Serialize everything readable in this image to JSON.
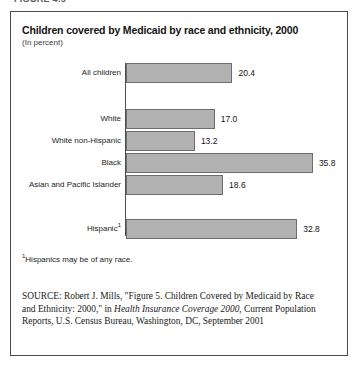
{
  "page": {
    "cutoff_header": "FIGURE 4.5"
  },
  "figure": {
    "title": "Children covered by Medicaid by race and ethnicity, 2000",
    "subtitle": "(In percent)",
    "footnote_marker": "1",
    "footnote_text": "Hispanics may be of any race.",
    "source": {
      "label": "SOURCE:",
      "part1": " Robert J. Mills, \"Figure 5. Children Covered by Medicaid by Race and Ethnicity: 2000,\" in ",
      "italic": "Health Insurance Coverage 2000,",
      "part2": " Current Population Reports, U.S. Census Bureau, Washington, DC, September 2001"
    }
  },
  "chart_data": {
    "type": "bar",
    "orientation": "horizontal",
    "title": "Children covered by Medicaid by race and ethnicity, 2000",
    "xlabel": "",
    "ylabel": "",
    "unit": "percent",
    "xlim": [
      0,
      40
    ],
    "grid": false,
    "legend": "none",
    "categories": [
      "All children",
      "White",
      "White non-Hispanic",
      "Black",
      "Asian and Pacific Islander",
      "Hispanic"
    ],
    "category_footnotes": [
      "",
      "",
      "",
      "",
      "",
      "1"
    ],
    "values": [
      20.4,
      17.0,
      13.2,
      35.8,
      18.6,
      32.8
    ],
    "value_labels": [
      "20.4",
      "17.0",
      "13.2",
      "35.8",
      "18.6",
      "32.8"
    ],
    "colors": {
      "bar_fill": "#b2b2b2",
      "bar_stroke": "#6e6e6e",
      "axis": "#4d4d4d",
      "frame": "#4a4a4a",
      "text": "#1a1a1a"
    },
    "row_tops": [
      7,
      53,
      75,
      97,
      119,
      163
    ],
    "pixels_per_unit": 5.22
  }
}
